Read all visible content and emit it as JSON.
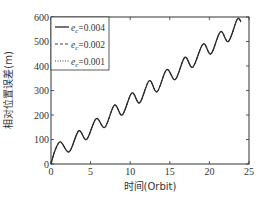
{
  "chart_data": {
    "type": "line",
    "title": "",
    "xlabel": "时间(Orbit)",
    "ylabel": "相对位置误差(m)",
    "xlim": [
      0,
      25
    ],
    "ylim": [
      0,
      600
    ],
    "xticks": [
      0,
      5,
      10,
      15,
      20,
      25
    ],
    "yticks": [
      0,
      100,
      200,
      300,
      400,
      500,
      600
    ],
    "grid": false,
    "legend_position": "upper left",
    "legend": [
      {
        "symbol": "e",
        "subscript": "c",
        "label": "=0.004",
        "style": "solid"
      },
      {
        "symbol": "e",
        "subscript": "c",
        "label": "=0.002",
        "style": "dashed"
      },
      {
        "symbol": "e",
        "subscript": "c",
        "label": "=0.001",
        "style": "dotted"
      }
    ],
    "series": [
      {
        "name": "ec=0.004",
        "x": [
          0,
          0.5,
          1.2,
          2.3,
          3.5,
          4.5,
          5.7,
          6.8,
          8.0,
          9.0,
          10.2,
          11.2,
          12.4,
          13.4,
          14.6,
          15.7,
          16.9,
          17.9,
          19.2,
          20.2,
          21.4,
          22.4,
          23.5,
          24.0
        ],
        "values": [
          0,
          55,
          90,
          50,
          135,
          100,
          185,
          150,
          240,
          200,
          290,
          250,
          340,
          295,
          385,
          345,
          435,
          395,
          490,
          450,
          540,
          500,
          590,
          580
        ]
      },
      {
        "name": "ec=0.002",
        "note": "overlaps ec=0.004 curve",
        "x": [
          0,
          0.5,
          1.2,
          2.3,
          3.5,
          4.5,
          5.7,
          6.8,
          8.0,
          9.0,
          10.2,
          11.2,
          12.4,
          13.4,
          14.6,
          15.7,
          16.9,
          17.9,
          19.2,
          20.2,
          21.4,
          22.4,
          23.5,
          24.0
        ],
        "values": [
          0,
          55,
          90,
          50,
          135,
          100,
          185,
          150,
          240,
          200,
          290,
          250,
          340,
          295,
          385,
          345,
          435,
          395,
          490,
          450,
          540,
          500,
          590,
          580
        ]
      },
      {
        "name": "ec=0.001",
        "note": "overlaps ec=0.004 curve",
        "x": [
          0,
          0.5,
          1.2,
          2.3,
          3.5,
          4.5,
          5.7,
          6.8,
          8.0,
          9.0,
          10.2,
          11.2,
          12.4,
          13.4,
          14.6,
          15.7,
          16.9,
          17.9,
          19.2,
          20.2,
          21.4,
          22.4,
          23.5,
          24.0
        ],
        "values": [
          0,
          55,
          90,
          50,
          135,
          100,
          185,
          150,
          240,
          200,
          290,
          250,
          340,
          295,
          385,
          345,
          435,
          395,
          490,
          450,
          540,
          500,
          590,
          580
        ]
      }
    ]
  }
}
